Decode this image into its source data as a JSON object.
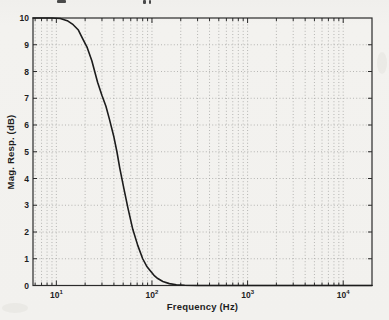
{
  "figure": {
    "cropped_caption_fragments": [
      "g",
      "pp"
    ],
    "caption_note": "top text line cropped by scan edge"
  },
  "style": {
    "paper_color": "#f2f1ee",
    "axis_color": "#2b2b2b",
    "grid_color": "#a6a6a3",
    "text_color": "#1e1e1e",
    "curve_color": "#1c1c1c"
  },
  "chart_data": {
    "type": "line",
    "title": "",
    "xlabel": "Frequency (Hz)",
    "ylabel": "Mag. Resp. (dB)",
    "x_scale": "log",
    "y_scale": "linear",
    "xlim": [
      5.7,
      20000
    ],
    "ylim": [
      0,
      10
    ],
    "x_ticks": [
      {
        "base": "10",
        "exp": "1",
        "value": 10
      },
      {
        "base": "10",
        "exp": "2",
        "value": 100
      },
      {
        "base": "10",
        "exp": "3",
        "value": 1000
      },
      {
        "base": "10",
        "exp": "4",
        "value": 10000
      }
    ],
    "y_ticks": [
      0,
      1,
      2,
      3,
      4,
      5,
      6,
      7,
      8,
      9,
      10
    ],
    "grid": {
      "style": "dotted",
      "horizontal_at": [
        1,
        2,
        3,
        4,
        5,
        6,
        7,
        8,
        9
      ],
      "vertical_at_log_minor_ticks": true
    },
    "legend": null,
    "series": [
      {
        "name": "lowpass magnitude response",
        "color": "#1c1c1c",
        "points": [
          [
            5.7,
            10.0
          ],
          [
            9,
            10.0
          ],
          [
            11,
            9.98
          ],
          [
            13,
            9.9
          ],
          [
            15,
            9.75
          ],
          [
            17,
            9.55
          ],
          [
            19,
            9.2
          ],
          [
            21,
            8.9
          ],
          [
            23.5,
            8.4
          ],
          [
            27,
            7.6
          ],
          [
            30,
            7.1
          ],
          [
            33,
            6.7
          ],
          [
            36,
            6.2
          ],
          [
            40,
            5.55
          ],
          [
            43,
            5.0
          ],
          [
            46,
            4.4
          ],
          [
            51,
            3.6
          ],
          [
            56,
            2.9
          ],
          [
            63,
            2.1
          ],
          [
            71,
            1.5
          ],
          [
            80,
            1.0
          ],
          [
            88,
            0.72
          ],
          [
            95,
            0.57
          ],
          [
            105,
            0.38
          ],
          [
            115,
            0.26
          ],
          [
            130,
            0.15
          ],
          [
            152,
            0.07
          ],
          [
            180,
            0.03
          ],
          [
            220,
            0.01
          ],
          [
            300,
            0.0
          ],
          [
            1000,
            0.0
          ],
          [
            5000,
            0.0
          ],
          [
            20000,
            0.0
          ]
        ]
      }
    ]
  }
}
